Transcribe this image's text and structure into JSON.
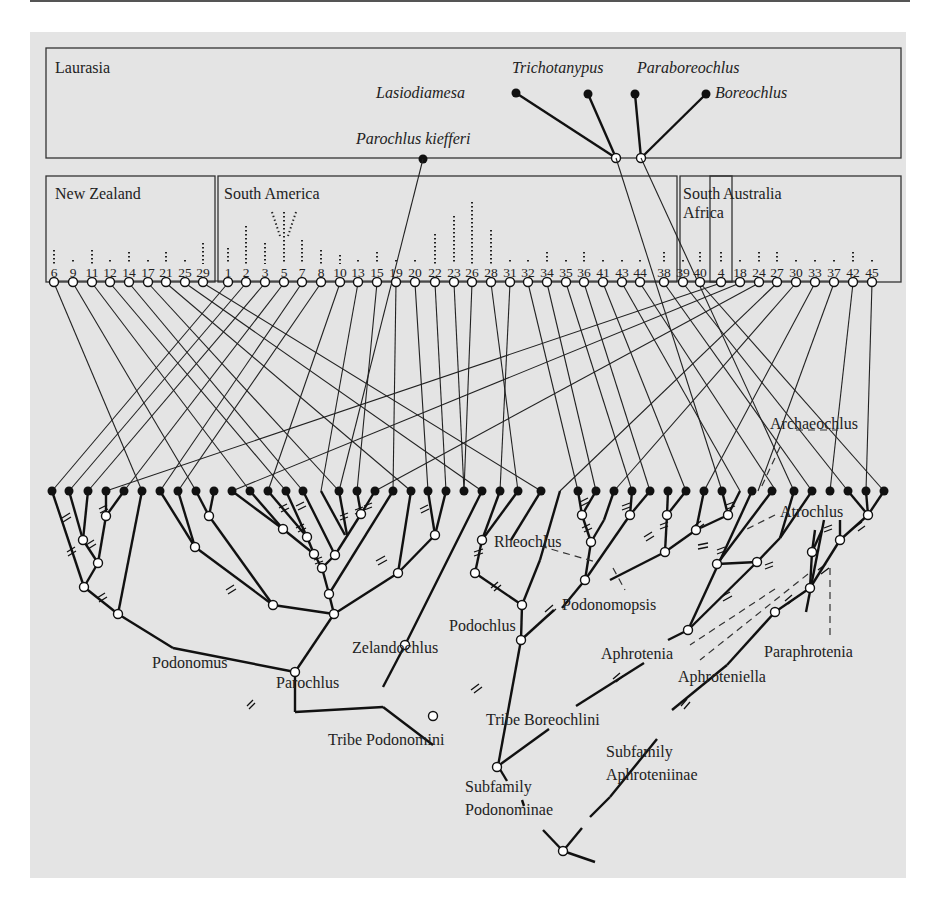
{
  "figure": {
    "regions": {
      "laurasia": "Laurasia",
      "new_zealand": "New Zealand",
      "south_america": "South America",
      "south_africa_line1": "South",
      "south_africa_line2": "Africa",
      "australia": "Australia"
    },
    "laurasian_taxa": {
      "trichotanypus": "Trichotanypus",
      "lasiodiamesa": "Lasiodiamesa",
      "paraboreochlus": "Paraboreochlus",
      "boreochlus": "Boreochlus",
      "parochlus_kiefferi": "Parochlus kiefferi"
    },
    "area_numbers": {
      "new_zealand": [
        "6",
        "9",
        "11",
        "12",
        "14",
        "17",
        "21",
        "25",
        "29"
      ],
      "south_america": [
        "1",
        "2",
        "3",
        "5",
        "7",
        "8",
        "10",
        "13",
        "15",
        "19",
        "20",
        "22",
        "23",
        "26",
        "28",
        "31",
        "32",
        "34",
        "35",
        "36",
        "41",
        "43",
        "44"
      ],
      "south_africa": [
        "38",
        "39",
        "40"
      ],
      "australia": [
        "4",
        "18",
        "24",
        "27",
        "30",
        "33",
        "37",
        "42",
        "45"
      ]
    },
    "clade_labels": {
      "archaeochlus": "Archaeochlus",
      "atrochlus": "Atrochlus",
      "rheochlus": "Rheochlus",
      "podonomopsis": "Podonomopsis",
      "podochlus": "Podochlus",
      "aphrotenia": "Aphrotenia",
      "paraphrotenia": "Paraphrotenia",
      "aphroteniella": "Aphroteniella",
      "podonomus": "Podonomus",
      "parochlus": "Parochlus",
      "zelandochlus": "Zelandochlus",
      "tribe_boreochlini": "Tribe Boreochlini",
      "tribe_podonomini": "Tribe Podonomini",
      "subfamily_aphroteniinae_line1": "Subfamily",
      "subfamily_aphroteniinae_line2": "Aphroteniinae",
      "subfamily_podonominae_line1": "Subfamily",
      "subfamily_podonominae_line2": "Podonominae"
    },
    "colors": {
      "panel_background": "#e4e4e4",
      "line": "#111111",
      "open_node": "#ffffff"
    }
  }
}
